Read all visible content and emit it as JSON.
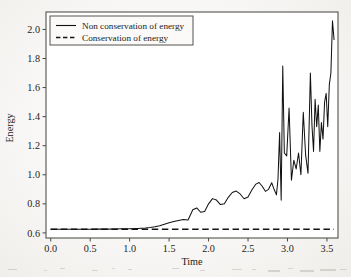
{
  "figure": {
    "background_color": "#f3f1ee",
    "plot_background_color": "#ffffff",
    "frame_color": "#4a4a48",
    "series_color": "#111110"
  },
  "axes": {
    "x_title": "Time",
    "y_title": "Energy",
    "x_ticks": [
      "0.0",
      "0.5",
      "1.0",
      "1.5",
      "2.0",
      "2.5",
      "3.0",
      "3.5"
    ],
    "y_ticks": [
      "0.6",
      "0.8",
      "1.0",
      "1.2",
      "1.4",
      "1.6",
      "1.8",
      "2.0"
    ]
  },
  "legend": {
    "position": "upper-left-inside",
    "entries": [
      {
        "label": "Non conservation of energy",
        "style": "solid"
      },
      {
        "label": "Conservation of energy",
        "style": "dashed"
      }
    ]
  },
  "chart_data": {
    "type": "line",
    "title": "",
    "xlabel": "Time",
    "ylabel": "Energy",
    "xlim": [
      -0.06,
      3.64
    ],
    "ylim": [
      0.565,
      2.12
    ],
    "xticks": [
      0.0,
      0.5,
      1.0,
      1.5,
      2.0,
      2.5,
      3.0,
      3.5
    ],
    "yticks": [
      0.6,
      0.8,
      1.0,
      1.2,
      1.4,
      1.6,
      1.8,
      2.0
    ],
    "grid": false,
    "legend_position": "upper left",
    "series": [
      {
        "name": "Non conservation of energy",
        "style": "solid",
        "color": "#111110",
        "x": [
          0.0,
          0.1,
          0.2,
          0.3,
          0.4,
          0.5,
          0.6,
          0.7,
          0.8,
          0.9,
          1.0,
          1.1,
          1.2,
          1.26,
          1.32,
          1.38,
          1.44,
          1.5,
          1.56,
          1.62,
          1.68,
          1.74,
          1.8,
          1.85,
          1.9,
          1.95,
          2.0,
          2.05,
          2.1,
          2.15,
          2.2,
          2.25,
          2.3,
          2.35,
          2.4,
          2.45,
          2.5,
          2.55,
          2.6,
          2.64,
          2.68,
          2.72,
          2.76,
          2.8,
          2.83,
          2.86,
          2.88,
          2.9,
          2.92,
          2.94,
          2.96,
          2.99,
          3.02,
          3.05,
          3.08,
          3.11,
          3.14,
          3.17,
          3.2,
          3.23,
          3.26,
          3.29,
          3.31,
          3.33,
          3.35,
          3.37,
          3.39,
          3.41,
          3.43,
          3.45,
          3.47,
          3.49,
          3.51,
          3.53,
          3.55,
          3.57,
          3.59
        ],
        "y": [
          0.625,
          0.625,
          0.625,
          0.625,
          0.625,
          0.625,
          0.626,
          0.626,
          0.627,
          0.628,
          0.629,
          0.631,
          0.634,
          0.637,
          0.642,
          0.65,
          0.66,
          0.67,
          0.678,
          0.686,
          0.692,
          0.689,
          0.759,
          0.772,
          0.742,
          0.748,
          0.8,
          0.836,
          0.826,
          0.795,
          0.8,
          0.845,
          0.878,
          0.888,
          0.868,
          0.835,
          0.847,
          0.897,
          0.936,
          0.947,
          0.921,
          0.886,
          0.9,
          0.945,
          0.9,
          0.862,
          0.973,
          1.29,
          0.824,
          1.748,
          1.15,
          1.13,
          1.46,
          0.962,
          1.1,
          1.04,
          1.15,
          1.0,
          1.43,
          1.135,
          1.01,
          1.7,
          1.34,
          1.16,
          1.52,
          1.33,
          1.48,
          1.16,
          1.36,
          1.245,
          1.5,
          1.56,
          1.33,
          1.62,
          1.7,
          2.06,
          1.93
        ]
      },
      {
        "name": "Conservation of energy",
        "style": "dashed",
        "color": "#141412",
        "x": [
          0.0,
          3.59
        ],
        "y": [
          0.625,
          0.625
        ]
      }
    ]
  }
}
